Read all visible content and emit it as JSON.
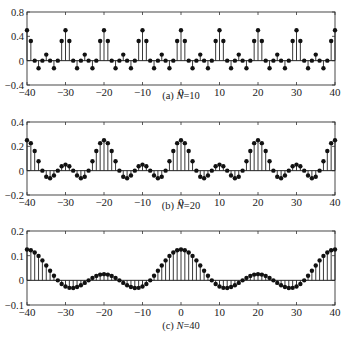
{
  "chart_data": [
    {
      "type": "stem",
      "caption": "(a) N=10",
      "caption_prefix": "(a) ",
      "caption_var": "N",
      "caption_suffix": "=10",
      "N": 10,
      "xlim": [
        -40,
        40
      ],
      "ylim": [
        -0.4,
        0.8
      ],
      "xticks": [
        -40,
        -30,
        -20,
        -10,
        0,
        10,
        20,
        30,
        40
      ],
      "yticks": [
        -0.4,
        0,
        0.4,
        0.8
      ],
      "ytick_labels": [
        "-0.4",
        "0",
        "0.4",
        "0.8"
      ],
      "period_values": [
        0.5,
        0.3236,
        0,
        -0.1236,
        0,
        0.1,
        0,
        -0.1236,
        0,
        0.3236
      ],
      "px": {
        "top": 12,
        "bottom": 85,
        "caption_y": 99
      }
    },
    {
      "type": "stem",
      "caption": "(b) N=20",
      "caption_prefix": "(b) ",
      "caption_var": "N",
      "caption_suffix": "=20",
      "N": 20,
      "xlim": [
        -40,
        40
      ],
      "ylim": [
        -0.2,
        0.4
      ],
      "xticks": [
        -40,
        -30,
        -20,
        -10,
        0,
        10,
        20,
        30,
        40
      ],
      "yticks": [
        -0.2,
        0,
        0.2,
        0.4
      ],
      "ytick_labels": [
        "-0.2",
        "0",
        "0.2",
        "0.4"
      ],
      "period_values": [
        0.25,
        0.226,
        0.1618,
        0.0779,
        0,
        -0.05,
        -0.0618,
        -0.0397,
        0,
        0.0358,
        0.05,
        0.0358,
        0,
        -0.0397,
        -0.0618,
        -0.05,
        0,
        0.0779,
        0.1618,
        0.226
      ],
      "px": {
        "top": 122,
        "bottom": 195,
        "caption_y": 209
      }
    },
    {
      "type": "stem",
      "caption": "(c) N=40",
      "caption_prefix": "(c) ",
      "caption_var": "N",
      "caption_suffix": "=40",
      "N": 40,
      "xlim": [
        -40,
        40
      ],
      "ylim": [
        -0.1,
        0.2
      ],
      "xticks": [
        -40,
        -30,
        -20,
        -10,
        0,
        10,
        20,
        30,
        40
      ],
      "yticks": [
        -0.1,
        0,
        0.1,
        0.2
      ],
      "ytick_labels": [
        "-0.1",
        "0",
        "0.1",
        "0.2"
      ],
      "period_values": [
        0.125,
        0.1219,
        0.113,
        0.099,
        0.0809,
        0.0604,
        0.0389,
        0.0183,
        0,
        -0.0147,
        -0.025,
        -0.0304,
        -0.0309,
        -0.0271,
        -0.0198,
        -0.0104,
        0,
        0.0098,
        0.0179,
        0.0232,
        0.025,
        0.0232,
        0.0179,
        0.0098,
        0,
        -0.0104,
        -0.0198,
        -0.0271,
        -0.0309,
        -0.0304,
        -0.025,
        -0.0147,
        0,
        0.0183,
        0.0389,
        0.0604,
        0.0809,
        0.099,
        0.113,
        0.1219
      ],
      "px": {
        "top": 231,
        "bottom": 305,
        "caption_y": 329
      }
    }
  ],
  "layout": {
    "plot_left_px": 27,
    "plot_right_px": 335,
    "tick_label_offset": 13
  }
}
